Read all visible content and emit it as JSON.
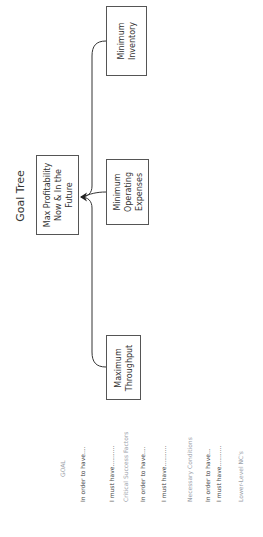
{
  "diagram": {
    "title": "Goal Tree",
    "goal_node": {
      "lines": [
        "Max Profitability",
        "Now & In the",
        "Future"
      ]
    },
    "critical_success_factors": [
      {
        "id": "inventory",
        "lines": [
          "Minimum",
          "Inventory"
        ]
      },
      {
        "id": "operating_expenses",
        "lines": [
          "Minimum",
          "Operating",
          "Expenses"
        ]
      },
      {
        "id": "throughput",
        "lines": [
          "Maximum",
          "Throughput"
        ]
      }
    ],
    "connectors": [
      {
        "from": "inventory",
        "to": "goal"
      },
      {
        "from": "operating_expenses",
        "to": "goal"
      },
      {
        "from": "throughput",
        "to": "goal"
      }
    ],
    "colors": {
      "box_border": "#555555",
      "line": "#333333",
      "legend_dark": "#444444",
      "legend_light": "#9aa0a8"
    }
  },
  "legend": {
    "goal": "GOAL",
    "in_order_1": "In order to have....",
    "must_have_1": "I must have...........",
    "csf": "Critical Success Factors",
    "in_order_2": "In order to have....",
    "must_have_2": "I must have...........",
    "nc": "Necessary Conditions",
    "in_order_3": "In order to have...",
    "must_have_3": "I must have...........",
    "lower": "Lower-Level NC's"
  }
}
